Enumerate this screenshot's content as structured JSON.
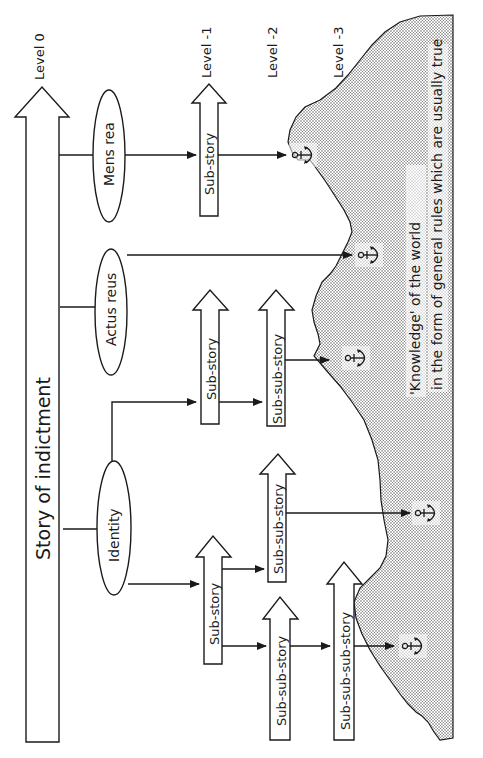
{
  "diagram": {
    "orientation": "rotated-90-ccw",
    "levels": [
      {
        "id": "level-0",
        "label": "Level  0"
      },
      {
        "id": "level-1",
        "label": "Level -1"
      },
      {
        "id": "level-2",
        "label": "Level -2"
      },
      {
        "id": "level-3",
        "label": "Level -3"
      }
    ],
    "main_story": {
      "label": "Story of indictment"
    },
    "elements": [
      {
        "id": "mens-rea",
        "label": "Mens rea"
      },
      {
        "id": "actus-reus",
        "label": "Actus reus"
      },
      {
        "id": "identity",
        "label": "Identity"
      }
    ],
    "stories": {
      "mens_rea_sub": "Sub-story",
      "identity_sub_a": "Sub-story",
      "identity_sub_a_subsub": "Sub-sub-story",
      "identity_sub_b": "Sub-story",
      "identity_sub_b_subsub": "Sub-sub-story",
      "identity_sub_b_subsub2": "Sub-sub-story",
      "identity_subsubsub": "Sub-sub-sub-story"
    },
    "knowledge": {
      "line1": "'Knowledge' of the world",
      "line2": "in the form of general rules which are usually true"
    },
    "anchor_count": 5,
    "colors": {
      "ink": "#1a1a1a",
      "background": "#ffffff",
      "land_dots": "#555555"
    }
  }
}
